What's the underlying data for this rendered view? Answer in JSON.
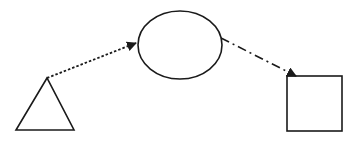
{
  "diagram": {
    "background": "#ffffff",
    "stroke_color": "#1a1a1a",
    "nodes": [
      {
        "id": "triangle",
        "shape": "triangle",
        "points": [
          [
            47,
            78
          ],
          [
            16,
            130
          ],
          [
            74,
            130
          ]
        ]
      },
      {
        "id": "ellipse",
        "shape": "ellipse",
        "cx": 180,
        "cy": 45,
        "rx": 42,
        "ry": 34
      },
      {
        "id": "square",
        "shape": "rect",
        "x": 287,
        "y": 76,
        "width": 55,
        "height": 55
      }
    ],
    "edges": [
      {
        "from": "triangle",
        "to": "ellipse",
        "style": "dotted",
        "x1": 47,
        "y1": 78,
        "x2": 136,
        "y2": 43
      },
      {
        "from": "ellipse",
        "to": "square",
        "style": "dash-dot",
        "x1": 221,
        "y1": 38,
        "x2": 296,
        "y2": 76
      }
    ]
  }
}
